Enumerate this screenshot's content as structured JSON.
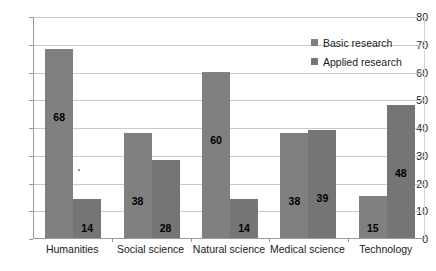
{
  "chart_data": {
    "type": "bar",
    "title": "",
    "subtitle": "",
    "xlabel": "",
    "ylabel": "",
    "categories": [
      "Humanities",
      "Social science",
      "Natural science",
      "Medical science",
      "Technology"
    ],
    "series": [
      {
        "name": "Basic research",
        "values": [
          68,
          38,
          60,
          38,
          15
        ],
        "color": "#808080"
      },
      {
        "name": "Applied research",
        "values": [
          14,
          28,
          14,
          39,
          48
        ],
        "color": "#757575"
      }
    ],
    "ylim": [
      0,
      80
    ],
    "ytick_step": 10,
    "yticks": [
      0,
      10,
      20,
      30,
      40,
      50,
      60,
      70,
      80
    ],
    "ytick_labels": [
      "0",
      "10",
      "20",
      "30",
      "40",
      "50",
      "60",
      "70",
      "80"
    ],
    "grid": "horizontal",
    "legend_position": "top-right-inside",
    "data_labels": true,
    "background_color": "#ffffff",
    "gridline_color": "#c9c9c9",
    "axis_color": "#9a9a9a"
  },
  "legend": {
    "entries": [
      {
        "label": "Basic research",
        "marker": "square-swatch"
      },
      {
        "label": "Applied research",
        "marker": "square-swatch"
      }
    ]
  }
}
